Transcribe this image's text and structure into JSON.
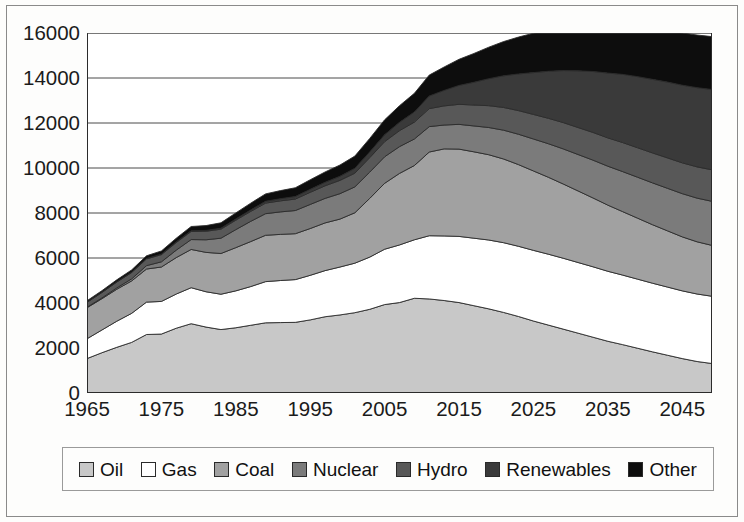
{
  "chart_data": {
    "type": "area",
    "stacked": true,
    "title": "",
    "subtitle": "",
    "xlabel": "",
    "ylabel": "",
    "xlim": [
      1965,
      2049
    ],
    "ylim": [
      0,
      16000
    ],
    "y_ticks": [
      0,
      2000,
      4000,
      6000,
      8000,
      10000,
      12000,
      14000,
      16000
    ],
    "y_tick_labels": [
      "0",
      "2000",
      "4000",
      "6000",
      "8000",
      "10000",
      "12000",
      "14000",
      "16000"
    ],
    "x_tick_labels": [
      "1965",
      "1975",
      "1985",
      "1995",
      "2005",
      "2015",
      "2025",
      "2035",
      "2045"
    ],
    "x_tick_values": [
      1965,
      1975,
      1985,
      1995,
      2005,
      2015,
      2025,
      2035,
      2045
    ],
    "x_minor_ticks": [
      1970,
      1980,
      1990,
      2000,
      2010,
      2020,
      2030,
      2040
    ],
    "grid": "horizontal",
    "legend_position": "bottom",
    "x": [
      1965,
      1967,
      1969,
      1971,
      1973,
      1975,
      1977,
      1979,
      1981,
      1983,
      1985,
      1987,
      1989,
      1991,
      1993,
      1995,
      1997,
      1999,
      2001,
      2003,
      2005,
      2007,
      2009,
      2011,
      2013,
      2015,
      2017,
      2019,
      2021,
      2023,
      2025,
      2027,
      2029,
      2031,
      2033,
      2035,
      2037,
      2039,
      2041,
      2043,
      2045,
      2047,
      2049
    ],
    "series": [
      {
        "name": "Oil",
        "color": "#c8c8c8",
        "values": [
          1530,
          1790,
          2030,
          2250,
          2600,
          2620,
          2880,
          3080,
          2930,
          2820,
          2900,
          3010,
          3120,
          3130,
          3140,
          3250,
          3390,
          3470,
          3570,
          3720,
          3930,
          4020,
          4210,
          4180,
          4110,
          4020,
          3880,
          3740,
          3580,
          3400,
          3200,
          3020,
          2840,
          2660,
          2480,
          2300,
          2150,
          1990,
          1830,
          1680,
          1530,
          1400,
          1310
        ]
      },
      {
        "name": "Gas",
        "color": "#ffffff",
        "values": [
          880,
          1010,
          1160,
          1290,
          1440,
          1450,
          1520,
          1600,
          1570,
          1570,
          1640,
          1720,
          1830,
          1870,
          1900,
          1980,
          2050,
          2130,
          2200,
          2320,
          2460,
          2560,
          2600,
          2810,
          2870,
          2940,
          3000,
          3060,
          3100,
          3120,
          3140,
          3150,
          3150,
          3140,
          3130,
          3110,
          3090,
          3070,
          3050,
          3030,
          3010,
          3000,
          2990
        ]
      },
      {
        "name": "Coal",
        "color": "#a1a1a1",
        "values": [
          1380,
          1390,
          1420,
          1440,
          1470,
          1530,
          1620,
          1700,
          1750,
          1810,
          1920,
          2000,
          2060,
          2050,
          2040,
          2080,
          2120,
          2130,
          2240,
          2610,
          2930,
          3180,
          3300,
          3720,
          3870,
          3880,
          3840,
          3790,
          3720,
          3630,
          3530,
          3420,
          3300,
          3180,
          3060,
          2940,
          2820,
          2710,
          2600,
          2500,
          2400,
          2320,
          2260
        ]
      },
      {
        "name": "Nuclear",
        "color": "#7b7b7b",
        "values": [
          20,
          35,
          60,
          95,
          150,
          230,
          330,
          440,
          560,
          680,
          800,
          900,
          960,
          1000,
          1030,
          1070,
          1090,
          1130,
          1150,
          1170,
          1180,
          1190,
          1180,
          1130,
          1060,
          1100,
          1150,
          1210,
          1280,
          1350,
          1420,
          1490,
          1560,
          1620,
          1680,
          1730,
          1780,
          1820,
          1860,
          1890,
          1920,
          1940,
          1960
        ]
      },
      {
        "name": "Hydro",
        "color": "#585858",
        "values": [
          220,
          240,
          260,
          280,
          300,
          320,
          340,
          360,
          380,
          400,
          420,
          440,
          470,
          490,
          510,
          540,
          560,
          590,
          610,
          640,
          670,
          710,
          750,
          800,
          850,
          890,
          930,
          970,
          1010,
          1050,
          1090,
          1130,
          1170,
          1200,
          1230,
          1260,
          1290,
          1310,
          1330,
          1350,
          1370,
          1390,
          1400
        ]
      },
      {
        "name": "Renewables",
        "color": "#3a3a3a",
        "values": [
          10,
          12,
          14,
          16,
          18,
          22,
          26,
          30,
          36,
          44,
          54,
          66,
          80,
          95,
          112,
          132,
          155,
          182,
          215,
          255,
          305,
          370,
          450,
          560,
          690,
          840,
          1010,
          1200,
          1410,
          1630,
          1860,
          2090,
          2310,
          2520,
          2710,
          2880,
          3030,
          3160,
          3270,
          3370,
          3450,
          3520,
          3570
        ]
      },
      {
        "name": "Other",
        "color": "#0d0d0d",
        "values": [
          60,
          70,
          85,
          100,
          120,
          140,
          165,
          190,
          215,
          240,
          270,
          300,
          330,
          360,
          390,
          425,
          460,
          500,
          545,
          600,
          665,
          740,
          830,
          930,
          1040,
          1160,
          1280,
          1400,
          1520,
          1640,
          1750,
          1850,
          1940,
          2020,
          2090,
          2150,
          2200,
          2240,
          2270,
          2300,
          2320,
          2340,
          2350
        ]
      }
    ]
  },
  "axes": {
    "y_labels": [
      "16000",
      "14000",
      "12000",
      "10000",
      "8000",
      "6000",
      "4000",
      "2000",
      "0"
    ],
    "x_labels": [
      "1965",
      "1975",
      "1985",
      "1995",
      "2005",
      "2015",
      "2025",
      "2035",
      "2045"
    ]
  },
  "legend": {
    "items": [
      {
        "label": "Oil",
        "color": "#c8c8c8"
      },
      {
        "label": "Gas",
        "color": "#ffffff"
      },
      {
        "label": "Coal",
        "color": "#a1a1a1"
      },
      {
        "label": "Nuclear",
        "color": "#7b7b7b"
      },
      {
        "label": "Hydro",
        "color": "#585858"
      },
      {
        "label": "Renewables",
        "color": "#3a3a3a"
      },
      {
        "label": "Other",
        "color": "#0d0d0d"
      }
    ]
  }
}
